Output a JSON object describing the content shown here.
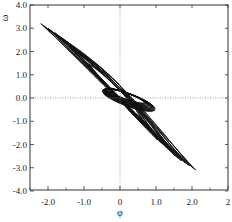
{
  "chart_data": {
    "type": "line",
    "title": "",
    "xlabel": "φ",
    "ylabel": "ω",
    "xlim": [
      -2.5,
      3.0
    ],
    "ylim": [
      -4.0,
      4.0
    ],
    "x_ticks": [
      {
        "value": -2.0,
        "label": "-2.0"
      },
      {
        "value": -1.0,
        "label": "-1.0"
      },
      {
        "value": 0.0,
        "label": "0"
      },
      {
        "value": 1.0,
        "label": "1.0"
      },
      {
        "value": 2.0,
        "label": "2.0"
      },
      {
        "value": 3.0,
        "label": "2"
      }
    ],
    "y_ticks": [
      {
        "value": 4.0,
        "label": "4.0"
      },
      {
        "value": 3.0,
        "label": "3.0"
      },
      {
        "value": 2.0,
        "label": "2.0"
      },
      {
        "value": 1.0,
        "label": "1.0"
      },
      {
        "value": 0.0,
        "label": "0.0"
      },
      {
        "value": -1.0,
        "label": "-1.0"
      },
      {
        "value": -2.0,
        "label": "-2.0"
      },
      {
        "value": -3.0,
        "label": "-3.0"
      },
      {
        "value": -4.0,
        "label": "-4.0"
      }
    ],
    "grid": false,
    "reference_lines": {
      "x0_dotted": true,
      "y0_dotted": true
    },
    "series": [
      {
        "name": "trajectory",
        "color": "#111111",
        "loops": [
          {
            "phi_min": -2.2,
            "omega_max": 3.2,
            "phi_max": 2.1,
            "omega_min": -3.1
          },
          {
            "phi_min": -2.0,
            "omega_max": 3.0,
            "phi_max": 1.9,
            "omega_min": -2.9
          },
          {
            "phi_min": -1.8,
            "omega_max": 2.8,
            "phi_max": 1.7,
            "omega_min": -2.7
          },
          {
            "phi_min": -1.6,
            "omega_max": 2.5,
            "phi_max": 1.5,
            "omega_min": -2.4
          },
          {
            "phi_min": -1.3,
            "omega_max": 2.1,
            "phi_max": 1.2,
            "omega_min": -2.0
          },
          {
            "phi_min": -1.0,
            "omega_max": 1.6,
            "phi_max": 0.9,
            "omega_min": -1.5
          }
        ]
      }
    ]
  }
}
